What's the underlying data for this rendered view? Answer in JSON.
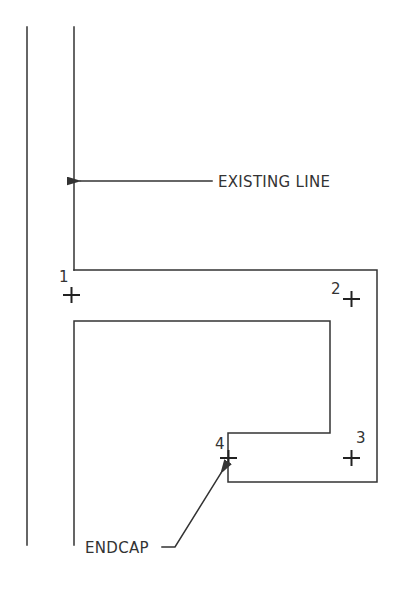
{
  "diagram": {
    "labels": {
      "existing_line": "EXISTING LINE",
      "endcap": "ENDCAP"
    },
    "points": [
      {
        "id": "1",
        "label": "1"
      },
      {
        "id": "2",
        "label": "2"
      },
      {
        "id": "3",
        "label": "3"
      },
      {
        "id": "4",
        "label": "4"
      }
    ],
    "colors": {
      "line": "#333333",
      "background": "#ffffff"
    }
  }
}
